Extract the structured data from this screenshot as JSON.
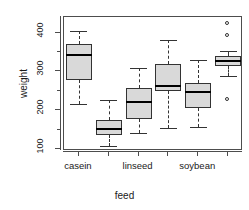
{
  "chart_data": {
    "type": "box",
    "title": "",
    "xlabel": "feed",
    "ylabel": "weight",
    "ylim": [
      95,
      440
    ],
    "yticks": [
      100,
      150,
      200,
      250,
      300,
      350,
      400
    ],
    "ytick_labels": [
      "100",
      "",
      "200",
      "",
      "300",
      "",
      "400"
    ],
    "ytick_major": [
      100,
      200,
      300,
      400
    ],
    "grid": false,
    "legend": "none",
    "categories": [
      "casein",
      "horsebean",
      "linseed",
      "meatmeal",
      "soybean",
      "sunflower"
    ],
    "visible_xtick_labels": [
      "casein",
      "",
      "linseed",
      "",
      "soybean",
      ""
    ],
    "boxes": [
      {
        "category": "casein",
        "whisker_low": 216,
        "q1": 277,
        "median": 342,
        "q3": 371,
        "whisker_high": 404,
        "outliers": []
      },
      {
        "category": "horsebean",
        "whisker_low": 108,
        "q1": 137,
        "median": 151.5,
        "q3": 176,
        "whisker_high": 227,
        "outliers": []
      },
      {
        "category": "linseed",
        "whisker_low": 141,
        "q1": 178,
        "median": 221,
        "q3": 257,
        "whisker_high": 309,
        "outliers": []
      },
      {
        "category": "meatmeal",
        "whisker_low": 153,
        "q1": 249.5,
        "median": 263,
        "q3": 320,
        "whisker_high": 380,
        "outliers": []
      },
      {
        "category": "soybean",
        "whisker_low": 158,
        "q1": 206.8,
        "median": 248,
        "q3": 270,
        "whisker_high": 329,
        "outliers": []
      },
      {
        "category": "sunflower",
        "whisker_low": 289,
        "q1": 312.8,
        "median": 328,
        "q3": 340.8,
        "whisker_high": 352,
        "outliers": [
          423,
          392,
          226
        ]
      }
    ]
  },
  "axis": {
    "y_label": "weight",
    "x_label": "feed"
  }
}
